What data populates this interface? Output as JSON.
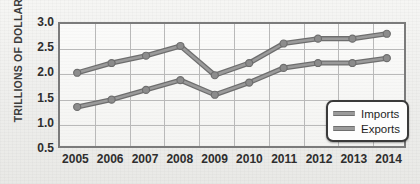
{
  "chart_data": {
    "type": "line",
    "title": "",
    "xlabel": "",
    "ylabel": "TRILLIONS OF DOLLARS",
    "categories": [
      "2005",
      "2006",
      "2007",
      "2008",
      "2009",
      "2010",
      "2011",
      "2012",
      "2013",
      "2014"
    ],
    "x": [
      2005,
      2006,
      2007,
      2008,
      2009,
      2010,
      2011,
      2012,
      2013,
      2014
    ],
    "series": [
      {
        "name": "Imports",
        "color": "#9a9a9a",
        "values": [
          2.0,
          2.2,
          2.35,
          2.55,
          1.95,
          2.2,
          2.6,
          2.7,
          2.7,
          2.8
        ]
      },
      {
        "name": "Exports",
        "color": "#9a9a9a",
        "values": [
          1.3,
          1.45,
          1.65,
          1.85,
          1.55,
          1.8,
          2.1,
          2.2,
          2.2,
          2.3
        ]
      }
    ],
    "ylim": [
      0.5,
      3.0
    ],
    "yticks": [
      "3.0",
      "2.5",
      "2.0",
      "1.5",
      "1.0",
      "0.5"
    ],
    "ytick_values": [
      3.0,
      2.5,
      2.0,
      1.5,
      1.0,
      0.5
    ],
    "grid": true,
    "grid_color": "#b9b9b9",
    "legend_position": "bottom-right",
    "legend_entries": [
      "Imports",
      "Exports"
    ],
    "marker": "circle",
    "marker_color": "#8c8c8c",
    "line_outline_color": "#6e6e6e",
    "plot_border_color": "#7b7b7b",
    "background_color": "#f2f2f0"
  }
}
